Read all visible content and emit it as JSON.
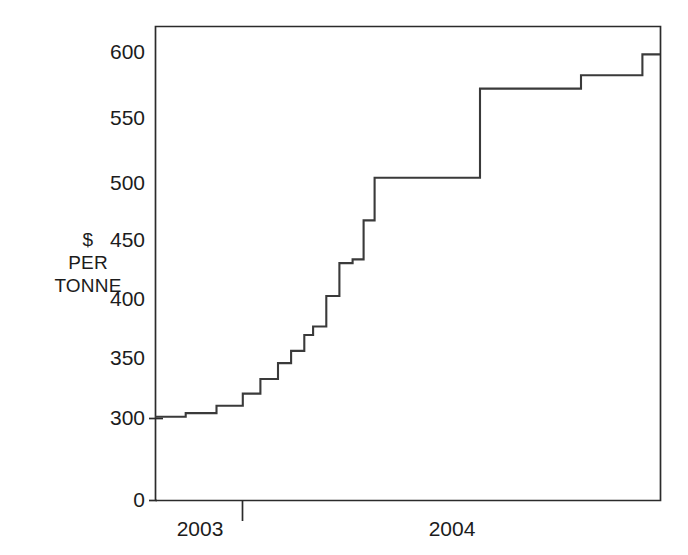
{
  "chart_data": {
    "type": "line",
    "title": "",
    "subtitle": "",
    "xlabel": "",
    "ylabel": "$ PER TONNE",
    "ylabel_lines": [
      "$",
      "PER",
      "TONNE"
    ],
    "style": "step",
    "grid": false,
    "legend": null,
    "ylim": [
      0,
      615
    ],
    "y_axis_break": true,
    "y_axis_break_note": "axis jumps from 0 directly to 300",
    "yticks": [
      0,
      300,
      350,
      400,
      450,
      500,
      550,
      600
    ],
    "ytick_labels": [
      "0",
      "300",
      "350",
      "400",
      "450",
      "500",
      "550",
      "600"
    ],
    "xticks": [
      2003,
      2004
    ],
    "xtick_labels": [
      "2003",
      "2004"
    ],
    "x_range": [
      2002.62,
      2004.92
    ],
    "x_divider_tick": 2003.42,
    "series": [
      {
        "name": "Price",
        "x": [
          2002.62,
          2002.76,
          2002.9,
          2003.02,
          2003.1,
          2003.18,
          2003.24,
          2003.3,
          2003.34,
          2003.4,
          2003.46,
          2003.52,
          2003.57,
          2003.62,
          2003.69,
          2004.1,
          2004.56,
          2004.84,
          2004.92
        ],
        "values": [
          301,
          304,
          310,
          320,
          332,
          345,
          355,
          368,
          375,
          400,
          427,
          430,
          462,
          497,
          497,
          570,
          581,
          598,
          598
        ],
        "steps": [
          {
            "x_start": 2002.62,
            "x_end": 2002.76,
            "value": 301
          },
          {
            "x_start": 2002.76,
            "x_end": 2002.9,
            "value": 304
          },
          {
            "x_start": 2002.9,
            "x_end": 2003.02,
            "value": 310
          },
          {
            "x_start": 2003.02,
            "x_end": 2003.1,
            "value": 320
          },
          {
            "x_start": 2003.1,
            "x_end": 2003.18,
            "value": 332
          },
          {
            "x_start": 2003.18,
            "x_end": 2003.24,
            "value": 345
          },
          {
            "x_start": 2003.24,
            "x_end": 2003.3,
            "value": 355
          },
          {
            "x_start": 2003.3,
            "x_end": 2003.34,
            "value": 368
          },
          {
            "x_start": 2003.34,
            "x_end": 2003.4,
            "value": 375
          },
          {
            "x_start": 2003.4,
            "x_end": 2003.46,
            "value": 400
          },
          {
            "x_start": 2003.46,
            "x_end": 2003.52,
            "value": 427
          },
          {
            "x_start": 2003.52,
            "x_end": 2003.57,
            "value": 430
          },
          {
            "x_start": 2003.57,
            "x_end": 2003.62,
            "value": 462
          },
          {
            "x_start": 2003.62,
            "x_end": 2004.1,
            "value": 497
          },
          {
            "x_start": 2004.1,
            "x_end": 2004.56,
            "value": 570
          },
          {
            "x_start": 2004.56,
            "x_end": 2004.84,
            "value": 581
          },
          {
            "x_start": 2004.84,
            "x_end": 2004.92,
            "value": 598
          }
        ]
      }
    ],
    "colors": {
      "line": "#3a3a3a",
      "axis": "#2b2b2b",
      "text": "#1c1c1c",
      "background": "#ffffff"
    }
  },
  "geometry": {
    "plot_left": 155,
    "plot_right": 660,
    "plot_top": 26,
    "plot_bottom": 500,
    "y_300_px": 418,
    "y_600_px": 52,
    "px_per_unit": 1.22
  }
}
